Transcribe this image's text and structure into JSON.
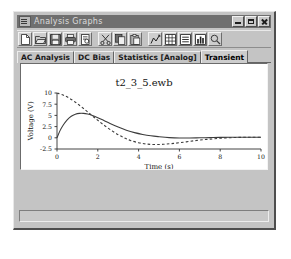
{
  "window": {
    "title": "Analysis Graphs",
    "icon": "graph-window-icon",
    "controls": {
      "minimize": "minimize-button",
      "maximize": "maximize-button",
      "close": "close-button"
    }
  },
  "toolbar": {
    "buttons": [
      {
        "name": "new-file",
        "icon": "new-document-icon"
      },
      {
        "name": "open-file",
        "icon": "open-folder-icon"
      },
      {
        "name": "save-file",
        "icon": "floppy-disk-icon"
      },
      {
        "name": "print",
        "icon": "printer-icon"
      },
      {
        "name": "print-preview",
        "icon": "print-preview-icon"
      },
      {
        "name": "cut",
        "icon": "scissors-icon"
      },
      {
        "name": "copy",
        "icon": "copy-icon"
      },
      {
        "name": "paste",
        "icon": "paste-icon"
      },
      {
        "name": "properties",
        "icon": "graph-properties-icon"
      },
      {
        "name": "toggle-grid",
        "icon": "grid-icon"
      },
      {
        "name": "toggle-legend",
        "icon": "legend-icon"
      },
      {
        "name": "toggle-cursors",
        "icon": "cursors-icon"
      },
      {
        "name": "zoom",
        "icon": "magnifier-icon"
      }
    ]
  },
  "tabs": [
    {
      "label": "AC Analysis",
      "active": false
    },
    {
      "label": "DC Bias",
      "active": false
    },
    {
      "label": "Statistics [Analog]",
      "active": false
    },
    {
      "label": "Transient",
      "active": true
    }
  ],
  "chart_data": {
    "type": "line",
    "title": "t2_3_5.ewb",
    "xlabel": "Time (s)",
    "ylabel": "Voltage (V)",
    "xlim": [
      0,
      10
    ],
    "ylim": [
      -2.5,
      10
    ],
    "xticks": [
      0,
      2,
      4,
      6,
      8,
      10
    ],
    "xtick_labels": [
      "0",
      "2",
      "4",
      "6",
      "8",
      "10"
    ],
    "yticks": [
      -2.5,
      0,
      2.5,
      5,
      7.5,
      10
    ],
    "ytick_labels": [
      "-2.5",
      "0",
      "2.5",
      "5",
      "7.5",
      "10"
    ],
    "grid": false,
    "legend": "none",
    "series": [
      {
        "name": "solid-trace",
        "style": "solid",
        "color": "#3c3c3c",
        "x": [
          0.0,
          0.15,
          0.3,
          0.5,
          0.7,
          0.9,
          1.1,
          1.3,
          1.5,
          1.7,
          2.0,
          2.3,
          2.6,
          3.0,
          3.4,
          3.8,
          4.2,
          4.6,
          5.0,
          5.5,
          6.0,
          6.5,
          7.0,
          7.5,
          8.0,
          8.5,
          9.0,
          9.5,
          10.0
        ],
        "y": [
          0.0,
          1.6,
          2.8,
          4.0,
          4.8,
          5.25,
          5.45,
          5.45,
          5.3,
          5.05,
          4.5,
          3.85,
          3.2,
          2.4,
          1.7,
          1.15,
          0.75,
          0.45,
          0.25,
          0.05,
          -0.05,
          -0.05,
          0.0,
          0.05,
          0.1,
          0.12,
          0.12,
          0.12,
          0.12
        ]
      },
      {
        "name": "dashed-trace",
        "style": "dashed",
        "color": "#3c3c3c",
        "x": [
          0.0,
          0.3,
          0.6,
          0.9,
          1.2,
          1.5,
          1.8,
          2.1,
          2.4,
          2.7,
          3.0,
          3.3,
          3.6,
          4.0,
          4.4,
          4.8,
          5.2,
          5.6,
          6.0,
          6.5,
          7.0,
          7.5,
          8.0,
          8.5,
          9.0,
          9.5,
          10.0
        ],
        "y": [
          10.0,
          9.55,
          8.85,
          7.95,
          6.9,
          5.8,
          4.65,
          3.55,
          2.5,
          1.55,
          0.7,
          0.0,
          -0.6,
          -1.1,
          -1.4,
          -1.5,
          -1.45,
          -1.3,
          -1.1,
          -0.8,
          -0.5,
          -0.3,
          -0.1,
          0.02,
          0.1,
          0.12,
          0.12
        ]
      }
    ]
  }
}
